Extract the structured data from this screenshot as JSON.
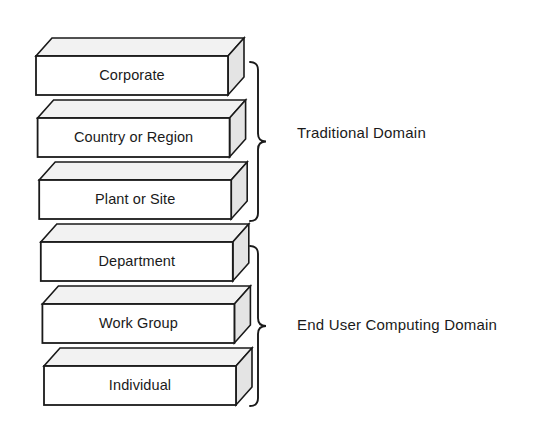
{
  "diagram": {
    "type": "layered-3d-block-stack",
    "background_color": "#ffffff",
    "stroke_color": "#1a1a1a",
    "front_face_color": "#ffffff",
    "top_face_color": "#f2f2f2",
    "side_face_color": "#e4e4e4",
    "text_color": "#1a1a1a",
    "layers": [
      {
        "id": "corporate",
        "label": "Corporate",
        "level": 1,
        "group": "traditional"
      },
      {
        "id": "country-or-region",
        "label": "Country or Region",
        "level": 2,
        "group": "traditional"
      },
      {
        "id": "plant-or-site",
        "label": "Plant or Site",
        "level": 3,
        "group": "traditional"
      },
      {
        "id": "department",
        "label": "Department",
        "level": 4,
        "group": "end-user-computing"
      },
      {
        "id": "work-group",
        "label": "Work Group",
        "level": 5,
        "group": "end-user-computing"
      },
      {
        "id": "individual",
        "label": "Individual",
        "level": 6,
        "group": "end-user-computing"
      }
    ],
    "groups": [
      {
        "id": "traditional",
        "label": "Traditional Domain",
        "covers": [
          "Corporate",
          "Country or Region",
          "Plant or Site"
        ],
        "bracket_top": 62,
        "bracket_bottom": 221,
        "label_x": 297,
        "label_y": 134
      },
      {
        "id": "end-user-computing",
        "label": "End User Computing Domain",
        "covers": [
          "Department",
          "Work Group",
          "Individual"
        ],
        "bracket_top": 246,
        "bracket_bottom": 406,
        "label_x": 297,
        "label_y": 326
      }
    ],
    "geometry": {
      "front_left_x": 36,
      "front_width": 192,
      "first_front_top_y": 56,
      "front_height": 39,
      "row_pitch": 62,
      "depth_dx": 16,
      "depth_dy": -18,
      "row_shift_dx": 1.6
    }
  }
}
